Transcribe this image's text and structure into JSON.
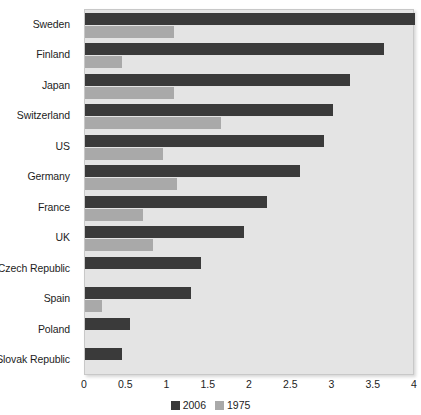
{
  "chart_data": {
    "type": "bar",
    "orientation": "horizontal",
    "title": "",
    "xlabel": "",
    "ylabel": "",
    "xlim": [
      0,
      4
    ],
    "xticks": [
      "0",
      "0.5",
      "1",
      "1.5",
      "2",
      "2.5",
      "3",
      "3.5",
      "4"
    ],
    "grid": false,
    "legend_position": "bottom-center",
    "categories": [
      "Sweden",
      "Finland",
      "Japan",
      "Switzerland",
      "US",
      "Germany",
      "France",
      "UK",
      "Czech Republic",
      "Spain",
      "Poland",
      "Slovak Republic"
    ],
    "series": [
      {
        "name": "2006",
        "color": "#3a3a3a",
        "values": [
          4.0,
          3.63,
          3.21,
          3.01,
          2.9,
          2.6,
          2.21,
          1.93,
          1.4,
          1.28,
          0.55,
          0.45
        ]
      },
      {
        "name": "1975",
        "color": "#a9a9a9",
        "values": [
          1.08,
          0.45,
          1.08,
          1.65,
          0.95,
          1.12,
          0.7,
          0.83,
          0.0,
          0.2,
          0.0,
          0.0
        ]
      }
    ]
  },
  "plot": {
    "background_color": "#e4e4e4",
    "border_color": "#c8c8c8"
  }
}
